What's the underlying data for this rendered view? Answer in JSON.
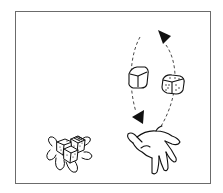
{
  "illustration": {
    "subject": "hand tossing dice in a circular arc, pile of dice on the left",
    "elements": [
      {
        "name": "dice-pile",
        "description": "cluster of three dice with hand-like outline"
      },
      {
        "name": "tossing-hand",
        "description": "open hand palm up"
      },
      {
        "name": "plain-die",
        "description": "blank cube in the air, left side of arc"
      },
      {
        "name": "dotted-die",
        "description": "die with pips in the air, right side of arc"
      },
      {
        "name": "arc-arrow-top",
        "description": "filled triangle arrowhead at top of arc"
      },
      {
        "name": "arc-arrow-bottom",
        "description": "filled triangle arrowhead at lower left of arc"
      }
    ],
    "colors": {
      "ink": "#1a1a1a",
      "frame": "#6b6b6b",
      "background": "#ffffff"
    }
  }
}
